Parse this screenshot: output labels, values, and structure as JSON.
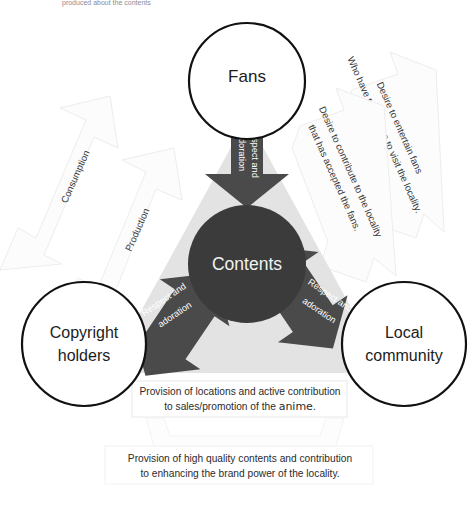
{
  "meta": {
    "cropped_top_text": "produced about the contents"
  },
  "colors": {
    "triangle_fill": "#e2e2e2",
    "center_circle_fill": "#3b3b3b",
    "arrow_fill": "#4a4a4a",
    "node_stroke": "#111111",
    "node_fill": "#ffffff",
    "faint_arrow_fill": "#fcfcfc",
    "faint_arrow_stroke": "#ececec",
    "caption_box_stroke": "#e4e4e4",
    "center_text": "#f2f2f2",
    "arrow_text": "#ffffff",
    "body_text": "#2b2b2b"
  },
  "nodes": [
    {
      "id": "fans",
      "label": "Fans",
      "lines": [
        "Fans"
      ]
    },
    {
      "id": "copyright-holders",
      "label": "Copyright holders",
      "lines": [
        "Copyright",
        "holders"
      ]
    },
    {
      "id": "local-community",
      "label": "Local community",
      "lines": [
        "Local",
        "community"
      ]
    }
  ],
  "center": {
    "id": "contents",
    "label": "Contents"
  },
  "dark_arrows": [
    {
      "id": "fans-to-contents",
      "label": "Respect and adoration",
      "lines": [
        "Respect and",
        "adoration"
      ],
      "from": "fans",
      "to": "contents",
      "direction": "down"
    },
    {
      "id": "copyright-to-contents",
      "label": "Respect and adoration",
      "lines": [
        "Respect and",
        "adoration"
      ],
      "from": "copyright-holders",
      "to": "contents",
      "direction": "up-right"
    },
    {
      "id": "local-to-contents",
      "label": "Respect and adoration",
      "lines": [
        "Respect and",
        "adoration"
      ],
      "from": "local-community",
      "to": "contents",
      "direction": "up-left"
    }
  ],
  "faint_arrows": [
    {
      "id": "consumption",
      "label": "Consumption",
      "lines": [
        "Consumption"
      ],
      "side": "left-outer"
    },
    {
      "id": "production",
      "label": "Production",
      "lines": [
        "Production"
      ],
      "side": "left-inner"
    },
    {
      "id": "desire-to-entertain-fans",
      "label": "Desire to entertain fans Who have taken time to visit the locality.",
      "lines": [
        "Desire to entertain fans",
        "Who have taken time to visit the locality."
      ],
      "side": "right-outer"
    },
    {
      "id": "desire-to-contribute-to-locality",
      "label": "Desire to contribute to the locality that has accepted the fans.",
      "lines": [
        "Desire to contribute to the locality",
        "that has accepted the fans."
      ],
      "side": "right-inner"
    }
  ],
  "captions": [
    {
      "id": "provision-of-locations",
      "lines": [
        {
          "text": "Provision of locations and active contribution"
        },
        {
          "pre": "to sales/promotion of the ",
          "accent": "anime",
          "post": "."
        }
      ]
    },
    {
      "id": "provision-of-contents",
      "lines": [
        {
          "text": "Provision of high quality contents and contribution"
        },
        {
          "text": "to enhancing the brand power of the locality."
        }
      ]
    }
  ]
}
